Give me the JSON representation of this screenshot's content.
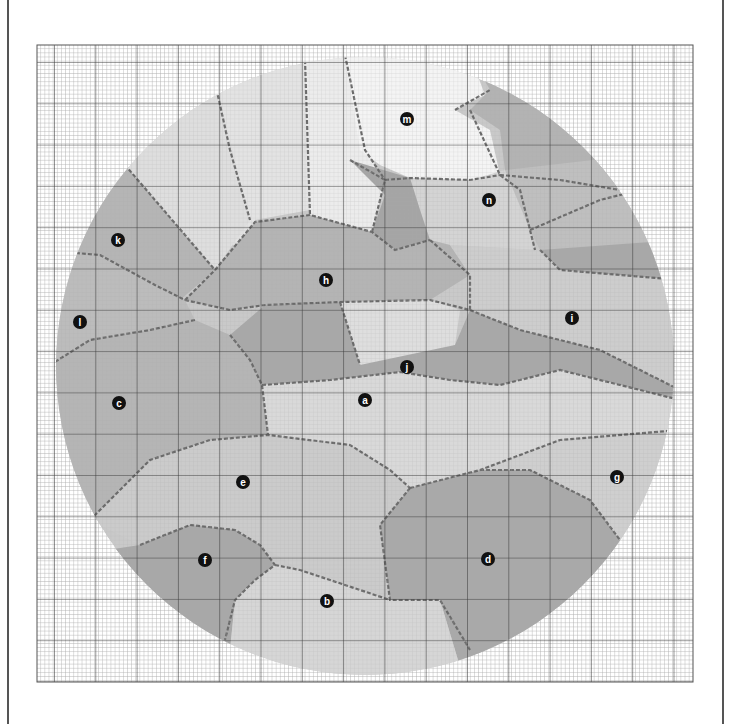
{
  "figure": {
    "kind": "grain-map-on-grid-paper",
    "grid": {
      "x0": 37,
      "y0": 45,
      "x1": 693,
      "y1": 682,
      "major_step": 41.3,
      "minor_per_major": 10,
      "major_color": "#444444",
      "minor_color": "#9a9a9a"
    },
    "circle": {
      "cx": 365,
      "cy": 366,
      "r": 309
    },
    "boundary_color": "#6a6a6a",
    "regions": [
      {
        "id": "a",
        "label": "a",
        "x": 365,
        "y": 400,
        "fill": "#d9d9d9"
      },
      {
        "id": "b",
        "label": "b",
        "x": 327,
        "y": 601,
        "fill": "#d6d6d6"
      },
      {
        "id": "c",
        "label": "c",
        "x": 119,
        "y": 403,
        "fill": "#b5b5b5"
      },
      {
        "id": "d",
        "label": "d",
        "x": 488,
        "y": 559,
        "fill": "#a9a9a9"
      },
      {
        "id": "e",
        "label": "e",
        "x": 243,
        "y": 482,
        "fill": "#cbcbcb"
      },
      {
        "id": "f",
        "label": "f",
        "x": 205,
        "y": 560,
        "fill": "#a8a8a8"
      },
      {
        "id": "g",
        "label": "g",
        "x": 617,
        "y": 477,
        "fill": "#cfcfcf"
      },
      {
        "id": "h",
        "label": "h",
        "x": 326,
        "y": 280,
        "fill": "#b4b4b4"
      },
      {
        "id": "i",
        "label": "i",
        "x": 572,
        "y": 318,
        "fill": "#cdcdcd"
      },
      {
        "id": "j",
        "label": "j",
        "x": 407,
        "y": 367,
        "fill": "#a6a6a6"
      },
      {
        "id": "k",
        "label": "k",
        "x": 118,
        "y": 240,
        "fill": "#b5b5b5"
      },
      {
        "id": "l",
        "label": "l",
        "x": 80,
        "y": 322,
        "fill": "#bcbcbc"
      },
      {
        "id": "m",
        "label": "m",
        "x": 407,
        "y": 119,
        "fill": "#f4f4f4"
      },
      {
        "id": "n",
        "label": "n",
        "x": 489,
        "y": 200,
        "fill": "#d4d4d4"
      }
    ]
  }
}
